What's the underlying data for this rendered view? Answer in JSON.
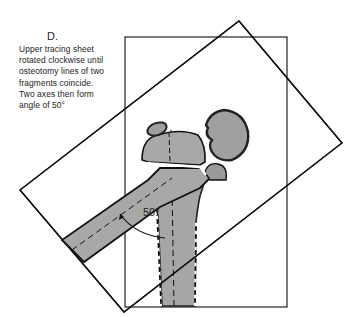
{
  "figure": {
    "panel_label": "D.",
    "caption_lines": [
      "Upper tracing sheet",
      "rotated clockwise until",
      "osteotomy  lines of two",
      "fragments coincide.",
      "Two axes then form",
      "angle  of 50°"
    ],
    "angle_label": "50°",
    "colors": {
      "bone_fill": "#a8a8a8",
      "bone_dark": "#555555",
      "line": "#111111",
      "background": "#ffffff"
    }
  }
}
